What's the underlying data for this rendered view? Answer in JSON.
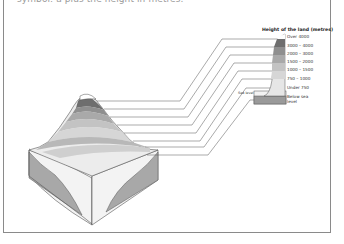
{
  "caption": "symbol: a plus the height in metres.",
  "legend": {
    "title": "Height of the land (metres)",
    "sea_level_label": "Sea level",
    "items": [
      {
        "label": "Over 4000",
        "color": "#ffffff"
      },
      {
        "label": "3000 – 4000",
        "color": "#6e6e6e"
      },
      {
        "label": "2000 – 3000",
        "color": "#8f8f8f"
      },
      {
        "label": "1500 – 2000",
        "color": "#a9a9a9"
      },
      {
        "label": "1000 – 1500",
        "color": "#c3c3c3"
      },
      {
        "label": "750 – 1000",
        "color": "#d6d6d6"
      },
      {
        "label": "Under 750",
        "color": "#e6e6e6"
      },
      {
        "label": "Below sea level",
        "color": "#9a9a9a"
      }
    ]
  }
}
